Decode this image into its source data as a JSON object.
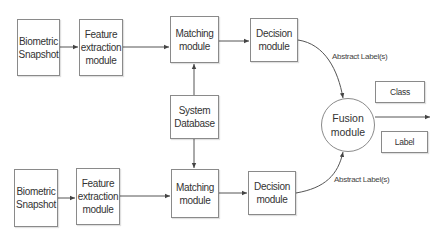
{
  "diagram": {
    "type": "multimodal biometric fusion block diagram",
    "top_branch": {
      "snapshot": "Biometric\nSnapshot",
      "feature": "Feature\nextraction\nmodule",
      "matching": "Matching\nmodule",
      "decision": "Decision\nmodule",
      "edge_label": "Abstract Label(s)"
    },
    "shared": {
      "database": "System\nDatabase",
      "fusion": "Fusion\nmodule"
    },
    "bottom_branch": {
      "snapshot": "Biometric\nSnapshot",
      "feature": "Feature\nextraction\nmodule",
      "matching": "Matching\nmodule",
      "decision": "Decision\nmodule",
      "edge_label": "Abstract Label(s)"
    },
    "outputs": {
      "class": "Class",
      "label": "Label"
    },
    "colors": {
      "stroke": "#8a8a8a",
      "line": "#555555",
      "text": "#333333",
      "background": "#ffffff"
    }
  }
}
